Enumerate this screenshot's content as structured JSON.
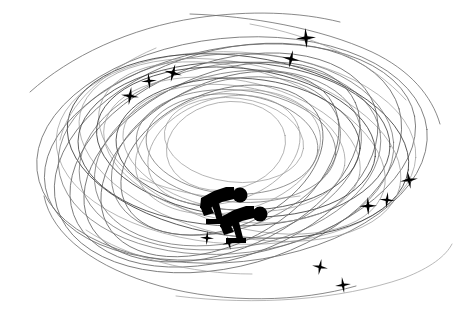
{
  "artwork": {
    "title": "Speed Skating Motion Swirl",
    "subject": "two speed skaters in racing crouch surrounded by motion swirl lines and sparkle stars",
    "style": "black silhouette clip art on white background",
    "canvas": {
      "width": 460,
      "height": 316
    },
    "colors": {
      "background": "#ffffff",
      "silhouette": "#000000",
      "star": "#000000",
      "swirl_line_dark": "#3a3a3a",
      "swirl_line_mid": "#6b6b6b",
      "swirl_line_light": "#9a9a9a"
    },
    "swirl": {
      "name": "motion-swirl-lines",
      "description": "overlapping thin elliptical arcs rotated at varying angles forming a nest-like rink trail",
      "stroke_width": 0.8,
      "count": 26,
      "ellipses": [
        {
          "cx": 232,
          "cy": 150,
          "rx": 196,
          "ry": 112,
          "rot": -6,
          "shade": "mid",
          "dash": "",
          "w": 0.8
        },
        {
          "cx": 230,
          "cy": 152,
          "rx": 188,
          "ry": 104,
          "rot": -11,
          "shade": "mid",
          "dash": "",
          "w": 0.8
        },
        {
          "cx": 236,
          "cy": 148,
          "rx": 180,
          "ry": 96,
          "rot": 3,
          "shade": "light",
          "dash": "",
          "w": 0.7
        },
        {
          "cx": 228,
          "cy": 158,
          "rx": 178,
          "ry": 108,
          "rot": -16,
          "shade": "mid",
          "dash": "",
          "w": 0.8
        },
        {
          "cx": 238,
          "cy": 146,
          "rx": 172,
          "ry": 90,
          "rot": 8,
          "shade": "dark",
          "dash": "",
          "w": 0.8
        },
        {
          "cx": 226,
          "cy": 154,
          "rx": 168,
          "ry": 100,
          "rot": -4,
          "shade": "mid",
          "dash": "",
          "w": 0.7
        },
        {
          "cx": 240,
          "cy": 150,
          "rx": 164,
          "ry": 86,
          "rot": 13,
          "shade": "light",
          "dash": "",
          "w": 0.7
        },
        {
          "cx": 224,
          "cy": 160,
          "rx": 160,
          "ry": 98,
          "rot": -20,
          "shade": "mid",
          "dash": "",
          "w": 0.8
        },
        {
          "cx": 234,
          "cy": 144,
          "rx": 156,
          "ry": 82,
          "rot": 1,
          "shade": "dark",
          "dash": "",
          "w": 0.8
        },
        {
          "cx": 230,
          "cy": 156,
          "rx": 152,
          "ry": 92,
          "rot": -9,
          "shade": "mid",
          "dash": "",
          "w": 0.7
        },
        {
          "cx": 242,
          "cy": 148,
          "rx": 148,
          "ry": 78,
          "rot": 17,
          "shade": "light",
          "dash": "",
          "w": 0.7
        },
        {
          "cx": 222,
          "cy": 162,
          "rx": 146,
          "ry": 88,
          "rot": -24,
          "shade": "mid",
          "dash": "",
          "w": 0.8
        },
        {
          "cx": 236,
          "cy": 142,
          "rx": 140,
          "ry": 74,
          "rot": 6,
          "shade": "dark",
          "dash": "",
          "w": 0.8
        },
        {
          "cx": 228,
          "cy": 158,
          "rx": 136,
          "ry": 84,
          "rot": -14,
          "shade": "mid",
          "dash": "",
          "w": 0.7
        },
        {
          "cx": 232,
          "cy": 150,
          "rx": 130,
          "ry": 70,
          "rot": 11,
          "shade": "light",
          "dash": "",
          "w": 0.7
        },
        {
          "cx": 220,
          "cy": 164,
          "rx": 128,
          "ry": 80,
          "rot": -28,
          "shade": "mid",
          "dash": "",
          "w": 0.8
        },
        {
          "cx": 238,
          "cy": 144,
          "rx": 122,
          "ry": 66,
          "rot": 2,
          "shade": "dark",
          "dash": "",
          "w": 0.8
        },
        {
          "cx": 226,
          "cy": 156,
          "rx": 118,
          "ry": 74,
          "rot": -18,
          "shade": "mid",
          "dash": "",
          "w": 0.7
        },
        {
          "cx": 234,
          "cy": 148,
          "rx": 112,
          "ry": 62,
          "rot": 9,
          "shade": "light",
          "dash": "",
          "w": 0.7
        },
        {
          "cx": 222,
          "cy": 160,
          "rx": 106,
          "ry": 68,
          "rot": -23,
          "shade": "mid",
          "dash": "",
          "w": 0.8
        },
        {
          "cx": 236,
          "cy": 146,
          "rx": 100,
          "ry": 56,
          "rot": 5,
          "shade": "mid",
          "dash": "",
          "w": 0.7
        },
        {
          "cx": 228,
          "cy": 152,
          "rx": 94,
          "ry": 60,
          "rot": -13,
          "shade": "light",
          "dash": "",
          "w": 0.7
        },
        {
          "cx": 232,
          "cy": 144,
          "rx": 86,
          "ry": 50,
          "rot": 4,
          "shade": "mid",
          "dash": "",
          "w": 0.7
        },
        {
          "cx": 224,
          "cy": 150,
          "rx": 78,
          "ry": 52,
          "rot": -17,
          "shade": "light",
          "dash": "",
          "w": 0.7
        },
        {
          "cx": 234,
          "cy": 140,
          "rx": 70,
          "ry": 42,
          "rot": 7,
          "shade": "light",
          "dash": "",
          "w": 0.7
        },
        {
          "cx": 226,
          "cy": 146,
          "rx": 60,
          "ry": 44,
          "rot": -10,
          "shade": "light",
          "dash": "",
          "w": 0.7
        }
      ],
      "tails": [
        {
          "d": "M 30 92 C 70 56, 130 28, 196 18 C 250 10, 300 12, 340 22",
          "shade": "mid",
          "w": 0.8
        },
        {
          "d": "M 190 14 C 250 16, 320 28, 372 52 C 410 70, 432 96, 440 124",
          "shade": "mid",
          "w": 0.8
        },
        {
          "d": "M 44 196 C 52 236, 96 268, 160 286 C 226 304, 300 302, 356 286",
          "shade": "mid",
          "w": 0.8
        },
        {
          "d": "M 176 296 C 256 306, 340 300, 404 278 C 430 268, 446 256, 452 244",
          "shade": "light",
          "w": 0.7
        },
        {
          "d": "M 250 24 C 316 36, 372 62, 406 100",
          "shade": "light",
          "w": 0.7
        },
        {
          "d": "M 60 140 C 68 104, 104 70, 156 48",
          "shade": "light",
          "w": 0.7
        },
        {
          "d": "M 86 230 C 128 258, 190 274, 252 274",
          "shade": "light",
          "w": 0.7
        },
        {
          "d": "M 300 196 C 246 204, 186 198, 140 178",
          "shade": "light",
          "w": 0.7
        }
      ]
    },
    "stars": {
      "name": "sparkle-stars",
      "description": "four-pointed concave sparkle stars scattered along the swirl trail",
      "items": [
        {
          "id": "star-upper-left-outer",
          "cx": 130,
          "cy": 96,
          "r": 9,
          "rot": 8,
          "label": "sparkle"
        },
        {
          "id": "star-upper-left-mid",
          "cx": 149,
          "cy": 81,
          "r": 8,
          "rot": -6,
          "label": "sparkle"
        },
        {
          "id": "star-upper-left-inner",
          "cx": 173,
          "cy": 73,
          "r": 9,
          "rot": 14,
          "label": "sparkle"
        },
        {
          "id": "star-top-right-high",
          "cx": 306,
          "cy": 38,
          "r": 10,
          "rot": -4,
          "label": "sparkle"
        },
        {
          "id": "star-top-right-low",
          "cx": 291,
          "cy": 59,
          "r": 9,
          "rot": 12,
          "label": "sparkle"
        },
        {
          "id": "star-right-upper",
          "cx": 409,
          "cy": 180,
          "r": 9,
          "rot": -10,
          "label": "sparkle"
        },
        {
          "id": "star-right-mid",
          "cx": 387,
          "cy": 200,
          "r": 8,
          "rot": 6,
          "label": "sparkle"
        },
        {
          "id": "star-right-lower",
          "cx": 368,
          "cy": 206,
          "r": 9,
          "rot": -2,
          "label": "sparkle"
        },
        {
          "id": "star-bottom-left",
          "cx": 320,
          "cy": 267,
          "r": 8,
          "rot": 10,
          "label": "sparkle"
        },
        {
          "id": "star-bottom-right",
          "cx": 343,
          "cy": 285,
          "r": 8,
          "rot": -8,
          "label": "sparkle"
        },
        {
          "id": "star-skater-left",
          "cx": 207,
          "cy": 238,
          "r": 7,
          "rot": 4,
          "label": "sparkle"
        },
        {
          "id": "star-skater-right",
          "cx": 229,
          "cy": 243,
          "r": 7,
          "rot": -12,
          "label": "sparkle"
        }
      ]
    },
    "skaters": {
      "name": "speed-skater-figures",
      "count": 2,
      "items": [
        {
          "id": "skater-rear",
          "label": "rear speed skater silhouette",
          "head": {
            "cx": 240,
            "cy": 195,
            "r": 7.5
          },
          "body": "M 201 198 L 214 191 L 226 187 L 234 187 L 234 199 L 222 202 L 214 206 L 206 210 L 200 208 Z",
          "arm": "M 200 206 L 210 205 L 214 213 L 204 216 Z",
          "leg": "M 212 205 L 219 203 L 223 219 L 217 221 Z",
          "blade": "M 206 219 L 226 219 L 226 224 L 206 224 Z"
        },
        {
          "id": "skater-front",
          "label": "front speed skater silhouette",
          "head": {
            "cx": 260,
            "cy": 214,
            "r": 7.5
          },
          "body": "M 221 217 L 234 210 L 246 206 L 254 206 L 254 218 L 242 221 L 234 225 L 226 229 L 220 227 Z",
          "arm": "M 220 225 L 230 224 L 234 232 L 224 235 Z",
          "leg": "M 232 224 L 239 222 L 243 238 L 237 240 Z",
          "blade": "M 226 238 L 246 238 L 246 243 L 226 243 Z"
        }
      ]
    }
  }
}
